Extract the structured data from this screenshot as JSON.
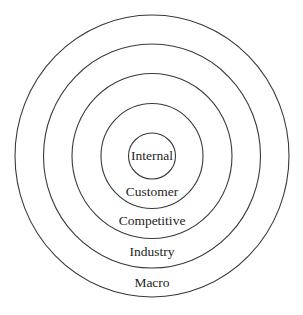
{
  "diagram": {
    "type": "concentric-circles",
    "center": {
      "x": 152,
      "y": 156
    },
    "stroke_color": "#3a3a3a",
    "text_color": "#1e1e1e",
    "rings": [
      {
        "label": "Internal",
        "rx": 23.5,
        "ry": 23,
        "label_y": 157
      },
      {
        "label": "Customer",
        "rx": 51,
        "ry": 52.5,
        "label_y": 193
      },
      {
        "label": "Competitive",
        "rx": 80,
        "ry": 82.5,
        "label_y": 222
      },
      {
        "label": "Industry",
        "rx": 108.5,
        "ry": 112,
        "label_y": 253
      },
      {
        "label": "Macro",
        "rx": 137,
        "ry": 141,
        "label_y": 284
      }
    ]
  }
}
